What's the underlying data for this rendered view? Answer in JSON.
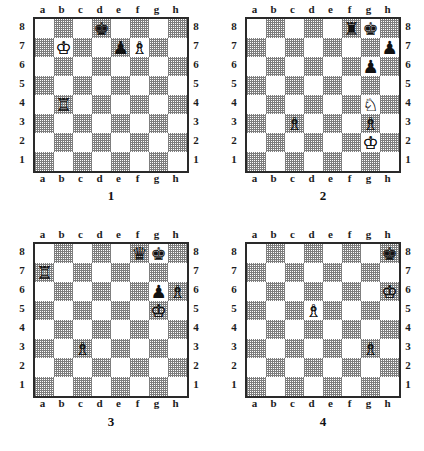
{
  "page": {
    "board_size": 8,
    "files": [
      "a",
      "b",
      "c",
      "d",
      "e",
      "f",
      "g",
      "h"
    ],
    "ranks": [
      "8",
      "7",
      "6",
      "5",
      "4",
      "3",
      "2",
      "1"
    ],
    "colors": {
      "light_square": "#ffffff",
      "dark_square": "#7d7d7d",
      "border": "#2a2a2a",
      "text": "#1c1c1c"
    },
    "glyphs": {
      "white_king": "♔",
      "white_queen": "♕",
      "white_rook": "♖",
      "white_bishop": "♗",
      "white_knight": "♘",
      "white_pawn": "♙",
      "black_king": "♚",
      "black_queen": "♛",
      "black_rook": "♜",
      "black_bishop": "♝",
      "black_knight": "♞",
      "black_pawn": "♟"
    }
  },
  "diagrams": [
    {
      "number": "1",
      "caption": "1",
      "pieces": [
        {
          "square": "d8",
          "color": "black",
          "type": "king",
          "glyph": "♚"
        },
        {
          "square": "b7",
          "color": "white",
          "type": "king",
          "glyph": "♔"
        },
        {
          "square": "e7",
          "color": "black",
          "type": "pawn",
          "glyph": "♟"
        },
        {
          "square": "f7",
          "color": "white",
          "type": "bishop",
          "glyph": "♗"
        },
        {
          "square": "b4",
          "color": "white",
          "type": "rook",
          "glyph": "♖"
        }
      ]
    },
    {
      "number": "2",
      "caption": "2",
      "pieces": [
        {
          "square": "f8",
          "color": "black",
          "type": "rook",
          "glyph": "♜"
        },
        {
          "square": "g8",
          "color": "black",
          "type": "king",
          "glyph": "♚"
        },
        {
          "square": "h7",
          "color": "black",
          "type": "pawn",
          "glyph": "♟"
        },
        {
          "square": "g6",
          "color": "black",
          "type": "pawn",
          "glyph": "♟"
        },
        {
          "square": "g4",
          "color": "white",
          "type": "knight",
          "glyph": "♘"
        },
        {
          "square": "c3",
          "color": "white",
          "type": "bishop",
          "glyph": "♗"
        },
        {
          "square": "g3",
          "color": "white",
          "type": "bishop",
          "glyph": "♗"
        },
        {
          "square": "g2",
          "color": "white",
          "type": "king",
          "glyph": "♔"
        }
      ]
    },
    {
      "number": "3",
      "caption": "3",
      "pieces": [
        {
          "square": "f8",
          "color": "black",
          "type": "queen",
          "glyph": "♛"
        },
        {
          "square": "g8",
          "color": "black",
          "type": "king",
          "glyph": "♚"
        },
        {
          "square": "a7",
          "color": "white",
          "type": "rook",
          "glyph": "♖"
        },
        {
          "square": "g6",
          "color": "black",
          "type": "pawn",
          "glyph": "♟"
        },
        {
          "square": "h6",
          "color": "white",
          "type": "bishop",
          "glyph": "♗"
        },
        {
          "square": "g5",
          "color": "white",
          "type": "king",
          "glyph": "♔"
        },
        {
          "square": "c3",
          "color": "white",
          "type": "bishop",
          "glyph": "♗"
        }
      ]
    },
    {
      "number": "4",
      "caption": "4",
      "pieces": [
        {
          "square": "h8",
          "color": "black",
          "type": "king",
          "glyph": "♚"
        },
        {
          "square": "h6",
          "color": "white",
          "type": "king",
          "glyph": "♔"
        },
        {
          "square": "d5",
          "color": "white",
          "type": "bishop",
          "glyph": "♗"
        },
        {
          "square": "g3",
          "color": "white",
          "type": "bishop",
          "glyph": "♗"
        }
      ]
    }
  ]
}
